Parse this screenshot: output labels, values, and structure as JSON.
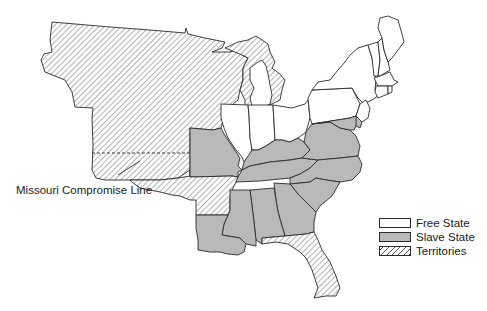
{
  "map": {
    "title": "",
    "annotation": "Missouri Compromise Line",
    "colors": {
      "free": "#ffffff",
      "slave": "#b9b9b9",
      "territory_hatch": "#555555",
      "border": "#2a2a2a"
    },
    "regions": [
      {
        "name": "Unorganized Territory (Louisiana Purchase)",
        "status": "territory"
      },
      {
        "name": "Michigan Territory (upper)",
        "status": "territory"
      },
      {
        "name": "Arkansas Territory",
        "status": "territory"
      },
      {
        "name": "Florida Territory",
        "status": "territory"
      },
      {
        "name": "Missouri",
        "status": "slave"
      },
      {
        "name": "Kentucky",
        "status": "slave"
      },
      {
        "name": "Tennessee",
        "status": "slave"
      },
      {
        "name": "Virginia",
        "status": "slave"
      },
      {
        "name": "North Carolina",
        "status": "slave"
      },
      {
        "name": "South Carolina",
        "status": "slave"
      },
      {
        "name": "Georgia",
        "status": "slave"
      },
      {
        "name": "Alabama",
        "status": "slave"
      },
      {
        "name": "Mississippi",
        "status": "slave"
      },
      {
        "name": "Louisiana",
        "status": "slave"
      },
      {
        "name": "Maryland",
        "status": "slave"
      },
      {
        "name": "Delaware",
        "status": "slave"
      },
      {
        "name": "Illinois",
        "status": "free"
      },
      {
        "name": "Indiana",
        "status": "free"
      },
      {
        "name": "Ohio",
        "status": "free"
      },
      {
        "name": "Michigan (lower)",
        "status": "free"
      },
      {
        "name": "Pennsylvania",
        "status": "free"
      },
      {
        "name": "New York",
        "status": "free"
      },
      {
        "name": "New Jersey",
        "status": "free"
      },
      {
        "name": "Vermont",
        "status": "free"
      },
      {
        "name": "New Hampshire",
        "status": "free"
      },
      {
        "name": "Maine",
        "status": "free"
      },
      {
        "name": "Massachusetts",
        "status": "free"
      },
      {
        "name": "Connecticut",
        "status": "free"
      },
      {
        "name": "Rhode Island",
        "status": "free"
      }
    ]
  },
  "legend": {
    "items": [
      {
        "label": "Free State",
        "key": "free"
      },
      {
        "label": "Slave State",
        "key": "slave"
      },
      {
        "label": "Territories",
        "key": "terr"
      }
    ]
  }
}
